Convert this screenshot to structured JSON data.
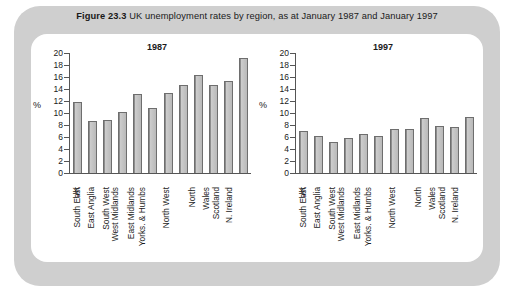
{
  "figure": {
    "label": "Figure 23.3",
    "caption": "UK unemployment rates by region, as at January 1987 and January 1997"
  },
  "chart_data": [
    {
      "type": "bar",
      "title": "1987",
      "xlabel": "",
      "ylabel": "%",
      "ylim": [
        0,
        20
      ],
      "yticks": [
        0,
        2,
        4,
        6,
        8,
        10,
        12,
        14,
        16,
        18,
        20
      ],
      "grid": false,
      "legend": "none",
      "categories": [
        "UK",
        "South East",
        "East Anglia",
        "South West",
        "West Midlands",
        "East Midlands",
        "Yorks. & Humbs",
        "North West",
        "North",
        "Wales",
        "Scotland",
        "N. Ireland"
      ],
      "values": [
        11.8,
        8.6,
        8.9,
        10.2,
        13.2,
        10.8,
        13.3,
        14.6,
        16.3,
        14.7,
        15.4,
        19.2
      ]
    },
    {
      "type": "bar",
      "title": "1997",
      "xlabel": "",
      "ylabel": "%",
      "ylim": [
        0,
        20
      ],
      "yticks": [
        0,
        2,
        4,
        6,
        8,
        10,
        12,
        14,
        16,
        18,
        20
      ],
      "grid": false,
      "legend": "none",
      "categories": [
        "UK",
        "South East",
        "East Anglia",
        "South West",
        "West Midlands",
        "East Midlands",
        "Yorks. & Humbs",
        "North West",
        "North",
        "Wales",
        "Scotland",
        "N. Ireland"
      ],
      "values": [
        7.0,
        6.2,
        5.2,
        5.8,
        6.5,
        6.2,
        7.4,
        7.4,
        9.2,
        7.8,
        7.6,
        9.4
      ]
    }
  ],
  "colors": {
    "frame": "#cfcfcf",
    "panel": "#ffffff",
    "bar_fill": "#c4c4c4",
    "bar_stroke": "#6e6e6e",
    "axis": "#555555",
    "text": "#1a1a1a"
  }
}
